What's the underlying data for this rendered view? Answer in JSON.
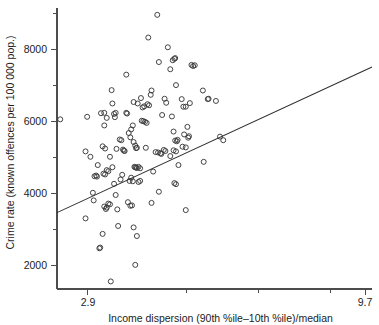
{
  "chart_data": {
    "type": "scatter",
    "title": "",
    "xlabel": "Income dispersion (90th %ile–10th %ile)/median",
    "ylabel": "Crime rate (known offences per 100 000 pop.)",
    "xlim": [
      2.14,
      9.87
    ],
    "ylim": [
      1350,
      9150
    ],
    "grid": false,
    "legend": null,
    "xticks": [
      2.9,
      5.31,
      7.08,
      8.85,
      9.7
    ],
    "xtick_labels": [
      "2.9",
      "",
      "",
      "",
      "9.7"
    ],
    "yticks": [
      2000,
      3000,
      4000,
      5000,
      6000,
      7000,
      8000,
      9000
    ],
    "ytick_labels": [
      "2000",
      "",
      "4000",
      "",
      "6000",
      "",
      "8000",
      ""
    ],
    "marker": "open-circle",
    "marker_radius": 2.5,
    "point_count": 143,
    "points": [
      [
        2.22,
        6060
      ],
      [
        2.88,
        6130
      ],
      [
        2.84,
        5170
      ],
      [
        2.96,
        5020
      ],
      [
        2.84,
        3310
      ],
      [
        3.02,
        4020
      ],
      [
        3.04,
        3810
      ],
      [
        3.06,
        4480
      ],
      [
        3.1,
        4500
      ],
      [
        3.12,
        4470
      ],
      [
        3.14,
        4790
      ],
      [
        3.18,
        2480
      ],
      [
        3.2,
        2500
      ],
      [
        3.26,
        2880
      ],
      [
        3.3,
        3640
      ],
      [
        3.34,
        3570
      ],
      [
        3.36,
        3610
      ],
      [
        3.4,
        3720
      ],
      [
        3.44,
        3700
      ],
      [
        3.46,
        1560
      ],
      [
        3.28,
        4550
      ],
      [
        3.32,
        4530
      ],
      [
        3.36,
        4650
      ],
      [
        3.4,
        4620
      ],
      [
        3.22,
        6230
      ],
      [
        3.3,
        6240
      ],
      [
        3.36,
        6100
      ],
      [
        3.3,
        5890
      ],
      [
        3.26,
        5310
      ],
      [
        3.32,
        5250
      ],
      [
        3.48,
        6870
      ],
      [
        3.5,
        6500
      ],
      [
        3.54,
        6210
      ],
      [
        3.58,
        6240
      ],
      [
        3.56,
        6120
      ],
      [
        3.6,
        5240
      ],
      [
        3.44,
        5020
      ],
      [
        3.5,
        4730
      ],
      [
        3.54,
        4270
      ],
      [
        3.58,
        3960
      ],
      [
        3.62,
        3560
      ],
      [
        3.64,
        3100
      ],
      [
        3.7,
        4390
      ],
      [
        3.74,
        4520
      ],
      [
        3.72,
        5480
      ],
      [
        3.76,
        5220
      ],
      [
        3.78,
        5190
      ],
      [
        3.8,
        5180
      ],
      [
        3.84,
        6240
      ],
      [
        3.86,
        6220
      ],
      [
        3.9,
        5680
      ],
      [
        3.94,
        5560
      ],
      [
        3.96,
        5780
      ],
      [
        4.0,
        5890
      ],
      [
        4.02,
        5430
      ],
      [
        4.06,
        5330
      ],
      [
        4.08,
        5260
      ],
      [
        4.1,
        5270
      ],
      [
        4.04,
        4740
      ],
      [
        4.06,
        4730
      ],
      [
        4.08,
        4720
      ],
      [
        4.1,
        4710
      ],
      [
        4.14,
        4740
      ],
      [
        4.18,
        4700
      ],
      [
        3.92,
        4350
      ],
      [
        3.96,
        4440
      ],
      [
        4.0,
        4340
      ],
      [
        4.14,
        4320
      ],
      [
        4.18,
        4350
      ],
      [
        3.88,
        3760
      ],
      [
        3.94,
        3660
      ],
      [
        3.98,
        3670
      ],
      [
        4.02,
        3060
      ],
      [
        4.1,
        2820
      ],
      [
        4.06,
        2020
      ],
      [
        3.84,
        7300
      ],
      [
        4.02,
        6540
      ],
      [
        4.12,
        6500
      ],
      [
        4.2,
        6650
      ],
      [
        4.24,
        6390
      ],
      [
        4.28,
        6420
      ],
      [
        4.22,
        6020
      ],
      [
        4.26,
        6010
      ],
      [
        4.3,
        5990
      ],
      [
        4.34,
        5960
      ],
      [
        4.36,
        6480
      ],
      [
        4.4,
        6450
      ],
      [
        4.44,
        6740
      ],
      [
        4.46,
        6860
      ],
      [
        4.38,
        8330
      ],
      [
        4.6,
        8960
      ],
      [
        4.64,
        7650
      ],
      [
        4.72,
        6180
      ],
      [
        4.56,
        5150
      ],
      [
        4.62,
        5140
      ],
      [
        4.68,
        5120
      ],
      [
        4.7,
        5100
      ],
      [
        4.5,
        4610
      ],
      [
        4.46,
        3740
      ],
      [
        4.64,
        4050
      ],
      [
        4.86,
        8060
      ],
      [
        4.92,
        7450
      ],
      [
        4.98,
        7700
      ],
      [
        5.02,
        7740
      ],
      [
        5.04,
        7760
      ],
      [
        5.06,
        7010
      ],
      [
        4.96,
        6140
      ],
      [
        5.0,
        5720
      ],
      [
        5.04,
        5470
      ],
      [
        5.08,
        5450
      ],
      [
        5.1,
        5490
      ],
      [
        4.92,
        5040
      ],
      [
        5.0,
        5200
      ],
      [
        5.06,
        5170
      ],
      [
        5.12,
        4790
      ],
      [
        5.02,
        4290
      ],
      [
        5.06,
        4260
      ],
      [
        5.2,
        6620
      ],
      [
        5.24,
        6410
      ],
      [
        5.3,
        6410
      ],
      [
        5.34,
        5850
      ],
      [
        5.38,
        5590
      ],
      [
        5.26,
        5640
      ],
      [
        5.22,
        5300
      ],
      [
        5.3,
        5280
      ],
      [
        5.44,
        7570
      ],
      [
        5.48,
        7540
      ],
      [
        5.52,
        7560
      ],
      [
        5.4,
        6510
      ],
      [
        5.36,
        5550
      ],
      [
        5.3,
        3540
      ],
      [
        5.72,
        6860
      ],
      [
        5.84,
        6620
      ],
      [
        5.86,
        6630
      ],
      [
        5.74,
        4880
      ],
      [
        6.04,
        6570
      ],
      [
        6.14,
        5580
      ],
      [
        6.22,
        5480
      ],
      [
        4.78,
        6630
      ],
      [
        4.82,
        6520
      ],
      [
        4.76,
        5210
      ],
      [
        4.8,
        5180
      ],
      [
        3.68,
        5500
      ],
      [
        4.32,
        5270
      ]
    ],
    "fit_line": {
      "label": "least-squares fit",
      "x1": 2.14,
      "y1": 3470,
      "x2": 9.87,
      "y2": 7510
    }
  }
}
